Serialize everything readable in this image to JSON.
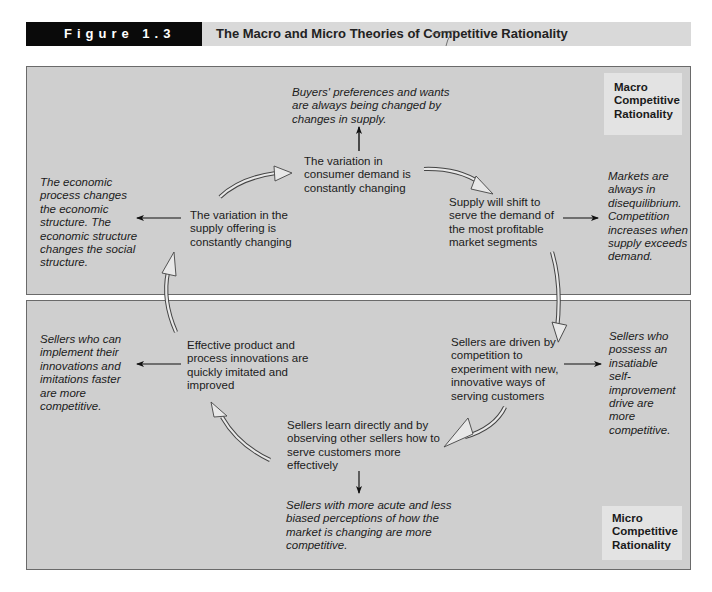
{
  "header": {
    "figure_label": "Figure 1.3",
    "title": "The Macro and Micro Theories of Competitive Rationality"
  },
  "macro": {
    "label": "Macro Competitive Rationality",
    "label_lines": [
      "Macro",
      "Competitive",
      "Rationality"
    ],
    "cycle": {
      "consumer_demand": "The variation in consumer demand is constantly changing",
      "supply_shift": "Supply will shift to serve the demand of the most profitable market segments",
      "supply_offering": "The variation in the supply offering is constantly changing"
    },
    "outcomes": {
      "buyers": "Buyers' preferences and wants are always being changed by changes in supply.",
      "markets": "Markets are always in disequilibrium. Competition increases when supply exceeds demand.",
      "economic": "The economic process changes the economic structure. The economic structure changes the social structure."
    }
  },
  "micro": {
    "label": "Micro Competitive Rationality",
    "label_lines": [
      "Micro",
      "Competitive",
      "Rationality"
    ],
    "cycle": {
      "sellers_driven": "Sellers are driven by competition to experiment with new, innovative ways of serving customers",
      "sellers_learn": "Sellers learn directly and by observing other sellers how to serve customers more effectively",
      "innovations": "Effective product and process innovations are quickly imitated and improved"
    },
    "outcomes": {
      "self_improvement": "Sellers who possess an insatiable self-improvement drive are more competitive.",
      "perceptions": "Sellers with more acute and less biased perceptions of how the market is changing are more competitive.",
      "faster": "Sellers who can implement their innovations and imitations faster are more competitive."
    }
  }
}
